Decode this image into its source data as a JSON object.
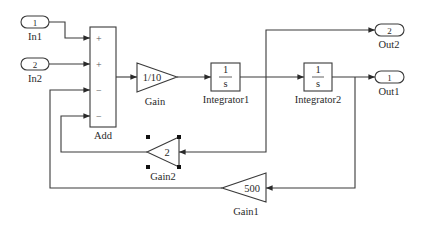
{
  "diagram": {
    "type": "simulink-block-diagram",
    "inports": [
      {
        "id": "in1",
        "number": "1",
        "label": "In1"
      },
      {
        "id": "in2",
        "number": "2",
        "label": "In2"
      }
    ],
    "outports": [
      {
        "id": "out2",
        "number": "2",
        "label": "Out2"
      },
      {
        "id": "out1",
        "number": "1",
        "label": "Out1"
      }
    ],
    "sum": {
      "label": "Add",
      "signs": [
        "+",
        "+",
        "−",
        "−"
      ]
    },
    "gains": [
      {
        "id": "gain",
        "label": "Gain",
        "value": "1/10"
      },
      {
        "id": "gain2",
        "label": "Gain2",
        "value": "2",
        "selected": true
      },
      {
        "id": "gain1",
        "label": "Gain1",
        "value": "500"
      }
    ],
    "integrators": [
      {
        "id": "integrator1",
        "label": "Integrator1",
        "num": "1",
        "den": "s"
      },
      {
        "id": "integrator2",
        "label": "Integrator2",
        "num": "1",
        "den": "s"
      }
    ],
    "connections": [
      {
        "from": "In1",
        "to": "Add (+)"
      },
      {
        "from": "In2",
        "to": "Add (+)"
      },
      {
        "from": "Gain1",
        "to": "Add (−)"
      },
      {
        "from": "Gain2",
        "to": "Add (−)"
      },
      {
        "from": "Add",
        "to": "Gain"
      },
      {
        "from": "Gain",
        "to": "Integrator1"
      },
      {
        "from": "Integrator1",
        "to": "Integrator2"
      },
      {
        "from": "Integrator1",
        "to": "Out2"
      },
      {
        "from": "Integrator1",
        "to": "Gain2"
      },
      {
        "from": "Integrator2",
        "to": "Out1"
      },
      {
        "from": "Integrator2",
        "to": "Gain1"
      }
    ]
  }
}
